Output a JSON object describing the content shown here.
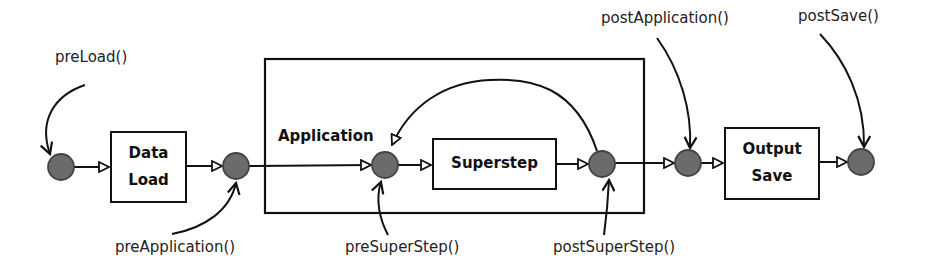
{
  "diagram": {
    "container": {
      "label": "Application"
    },
    "boxes": [
      {
        "id": "data-load",
        "line1": "Data",
        "line2": "Load"
      },
      {
        "id": "superstep",
        "line1": "Superstep"
      },
      {
        "id": "output-save",
        "line1": "Output",
        "line2": "Save"
      }
    ],
    "hooks": {
      "preLoad": "preLoad()",
      "preApplication": "preApplication()",
      "preSuperStep": "preSuperStep()",
      "postSuperStep": "postSuperStep()",
      "postApplication": "postApplication()",
      "postSave": "postSave()"
    },
    "colors": {
      "node_fill": "#6b6b6b",
      "node_stroke": "#444444",
      "line": "#111111",
      "background": "#ffffff"
    }
  }
}
